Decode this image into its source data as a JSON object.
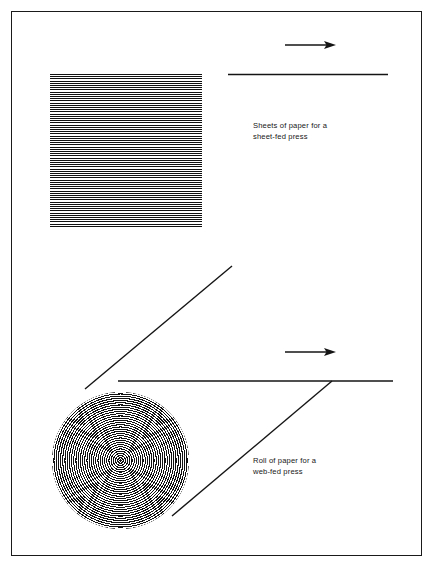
{
  "figure": {
    "background_color": "#ffffff",
    "ink_color": "#111111",
    "border": {
      "name": "figure-frame",
      "color": "#1a1a1a",
      "width_px": 1.6
    }
  },
  "diagram_data": {
    "type": "diagram",
    "description": "Technical illustration comparing paper supply formats for printing presses: a stack of cut sheets for a sheet-fed press, and a continuous roll (web) of paper for a web-fed press.",
    "elements": [
      {
        "name": "sheet-stack",
        "kind": "striped-square",
        "label": "Stack of cut paper sheets",
        "x": 50,
        "y": 74,
        "width": 152,
        "height": 154,
        "stripe_period_px": 2.2,
        "stripe_count": 70,
        "orientation": "horizontal"
      },
      {
        "name": "paper-roll",
        "kind": "concentric-spiral-circle",
        "label": "Roll of paper seen end-on",
        "center_x": 120,
        "center_y": 460,
        "radius": 68,
        "ring_period_px": 2.2,
        "ring_count": 31
      },
      {
        "name": "sheet-feed-line",
        "kind": "line",
        "label": "Web path of sheets entering press",
        "x1": 228,
        "y1": 74,
        "x2": 388,
        "y2": 74
      },
      {
        "name": "sheet-feed-arrow",
        "kind": "arrow",
        "label": "Direction of sheet travel",
        "x1": 285,
        "y1": 45,
        "x2": 335,
        "y2": 45,
        "direction": "right"
      },
      {
        "name": "web-top-tangent-line",
        "kind": "line",
        "label": "Unwinding web leaving top of roll",
        "x1": 85,
        "y1": 389,
        "x2": 232,
        "y2": 266
      },
      {
        "name": "web-horizontal-line",
        "kind": "line",
        "label": "Web travelling horizontally into press",
        "x1": 120,
        "y1": 381,
        "x2": 393,
        "y2": 381
      },
      {
        "name": "web-lower-tangent-line",
        "kind": "line",
        "label": "Web path below roll",
        "x1": 172,
        "y1": 516,
        "x2": 332,
        "y2": 381
      },
      {
        "name": "web-feed-arrow",
        "kind": "arrow",
        "label": "Direction of web travel",
        "x1": 285,
        "y1": 352,
        "x2": 335,
        "y2": 352,
        "direction": "right"
      }
    ]
  },
  "captions": {
    "sheet_fed": "Sheets of paper for a\nsheet-fed press",
    "web_fed": "Roll of paper for a\nweb-fed press"
  }
}
